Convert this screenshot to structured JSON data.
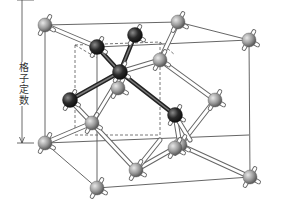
{
  "diagram": {
    "dimension_label": "格子定数",
    "dimension_arrow": {
      "x": 22,
      "y1": 25,
      "y2": 143
    },
    "colors": {
      "background": "#ffffff",
      "cube_edge": "#555555",
      "dashed_edge": "#555555",
      "white_bond_fill": "#ffffff",
      "white_bond_stroke": "#666666",
      "dark_bond": "#4a4a4a",
      "gray_atom": "#9a9a9a",
      "dark_atom": "#2a2a2a"
    },
    "outer_cube": {
      "solid_edges": [
        [
          45,
          25,
          178,
          22
        ],
        [
          45,
          25,
          97,
          47
        ],
        [
          178,
          22,
          249,
          40
        ],
        [
          97,
          47,
          249,
          40
        ],
        [
          45,
          25,
          45,
          143
        ],
        [
          45,
          143,
          97,
          188
        ],
        [
          97,
          188,
          250,
          177
        ],
        [
          249,
          40,
          250,
          177
        ],
        [
          97,
          47,
          97,
          188
        ],
        [
          45,
          143,
          249,
          135
        ]
      ],
      "dashed_edges": [
        [
          75,
          45,
          75,
          135
        ],
        [
          75,
          45,
          160,
          42
        ],
        [
          160,
          42,
          160,
          135
        ],
        [
          75,
          135,
          160,
          135
        ],
        [
          75,
          45,
          97,
          58
        ],
        [
          160,
          42,
          175,
          55
        ]
      ]
    },
    "bonds_white": [
      [
        45,
        143,
        92,
        123
      ],
      [
        92,
        123,
        136,
        170
      ],
      [
        136,
        170,
        180,
        145
      ],
      [
        180,
        145,
        215,
        100
      ],
      [
        92,
        123,
        115,
        85
      ],
      [
        180,
        145,
        250,
        177
      ],
      [
        45,
        25,
        97,
        47
      ],
      [
        180,
        145,
        175,
        115
      ],
      [
        160,
        60,
        215,
        100
      ],
      [
        160,
        60,
        178,
        22
      ],
      [
        120,
        72,
        160,
        60
      ],
      [
        175,
        115,
        190,
        140
      ],
      [
        92,
        123,
        70,
        100
      ],
      [
        136,
        170,
        160,
        140
      ]
    ],
    "bonds_dark": [
      [
        120,
        72,
        97,
        47
      ],
      [
        120,
        72,
        135,
        35
      ],
      [
        120,
        72,
        70,
        100
      ],
      [
        120,
        72,
        175,
        115
      ]
    ],
    "atoms_gray": [
      {
        "x": 45,
        "y": 25
      },
      {
        "x": 178,
        "y": 22
      },
      {
        "x": 249,
        "y": 40
      },
      {
        "x": 45,
        "y": 143
      },
      {
        "x": 97,
        "y": 188
      },
      {
        "x": 250,
        "y": 177
      },
      {
        "x": 92,
        "y": 123
      },
      {
        "x": 136,
        "y": 170
      },
      {
        "x": 180,
        "y": 145
      },
      {
        "x": 215,
        "y": 100
      },
      {
        "x": 160,
        "y": 60
      },
      {
        "x": 175,
        "y": 148
      },
      {
        "x": 118,
        "y": 88
      }
    ],
    "atoms_dark": [
      {
        "x": 97,
        "y": 47
      },
      {
        "x": 135,
        "y": 35
      },
      {
        "x": 120,
        "y": 72
      },
      {
        "x": 70,
        "y": 100
      },
      {
        "x": 175,
        "y": 115
      }
    ],
    "stub_angles_deg": [
      -60,
      30,
      120
    ]
  }
}
